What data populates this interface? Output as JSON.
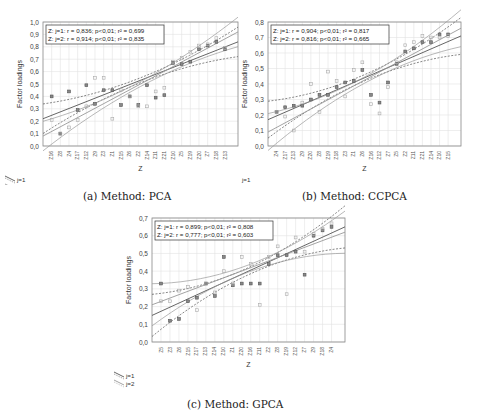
{
  "figure": {
    "captions": [
      "(a) Method: PCA",
      "(b) Method: CCPCA",
      "(c) Method: GPCA"
    ]
  },
  "chart_data": [
    {
      "type": "scatter",
      "title": "(a) Method: PCA",
      "xlabel": "Z",
      "ylabel": "Factor loadings",
      "ylim": [
        0.0,
        1.0
      ],
      "yticks": [
        "0,0",
        "0,1",
        "0,2",
        "0,3",
        "0,4",
        "0,5",
        "0,6",
        "0,7",
        "0,8",
        "0,9",
        "1,0"
      ],
      "grid": true,
      "categories": [
        "Z16",
        "Z8",
        "Z4",
        "Z17",
        "Z12",
        "Z9",
        "Z3",
        "Z1",
        "Z15",
        "Z6",
        "Z2",
        "Z14",
        "Z11",
        "Z21",
        "Z10",
        "Z5",
        "Z19",
        "Z20",
        "Z7",
        "Z18",
        "Z13"
      ],
      "stats_box": [
        "Z: j=1:   r = 0,836; p<0,01; r² = 0,699",
        "Z: j=2:   r = 0,914; p<0,01; r² = 0,835"
      ],
      "legend": [
        "j=1",
        "j=2"
      ],
      "legend_position": "bottom-left outside",
      "series": [
        {
          "name": "j=1",
          "values": [
            0.4,
            0.1,
            0.44,
            0.29,
            0.49,
            0.34,
            0.45,
            0.45,
            0.33,
            0.4,
            0.33,
            0.49,
            0.39,
            0.41,
            0.67,
            0.66,
            0.68,
            0.78,
            0.81,
            0.84,
            0.78
          ]
        },
        {
          "name": "j=2",
          "values": [
            0.21,
            0.1,
            0.15,
            0.21,
            0.32,
            0.55,
            0.55,
            0.22,
            0.45,
            0.4,
            0.32,
            0.32,
            0.44,
            0.47,
            0.68,
            0.71,
            0.76,
            0.81,
            0.82,
            0.87,
            0.79
          ]
        }
      ],
      "fit_lines": [
        {
          "name": "j=1",
          "y_start": 0.22,
          "y_end": 0.84,
          "ci": true
        },
        {
          "name": "j=2",
          "y_start": 0.08,
          "y_end": 0.92,
          "ci": true
        }
      ]
    },
    {
      "type": "scatter",
      "title": "(b) Method: CCPCA",
      "xlabel": "Z",
      "ylabel": "Factor loadings",
      "ylim": [
        0.0,
        0.8
      ],
      "yticks": [
        "0,0",
        "0,1",
        "0,2",
        "0,3",
        "0,4",
        "0,5",
        "0,6",
        "0,7",
        "0,8"
      ],
      "grid": true,
      "categories": [
        "Z4",
        "Z17",
        "Z13",
        "Z9",
        "Z20",
        "Z8",
        "Z19",
        "Z18",
        "Z3",
        "Z1",
        "Z6",
        "Z16",
        "Z12",
        "Z7",
        "Z5",
        "Z2",
        "Z11",
        "Z21",
        "Z14",
        "Z10",
        "Z15"
      ],
      "stats_box": [
        "Z: j=1:   r = 0,904; p<0,01; r² = 0,817",
        "Z: j=2:   r = 0,816; p<0,01; r² = 0,665"
      ],
      "legend": [
        "j=1",
        "j=2"
      ],
      "legend_position": "bottom-left outside",
      "series": [
        {
          "name": "j=1",
          "values": [
            0.22,
            0.25,
            0.26,
            0.26,
            0.3,
            0.33,
            0.33,
            0.38,
            0.41,
            0.42,
            0.49,
            0.33,
            0.28,
            0.41,
            0.53,
            0.61,
            0.63,
            0.67,
            0.67,
            0.72,
            0.72
          ]
        },
        {
          "name": "j=2",
          "values": [
            0.22,
            0.19,
            0.1,
            0.28,
            0.4,
            0.22,
            0.48,
            0.42,
            0.32,
            0.49,
            0.54,
            0.27,
            0.21,
            0.38,
            0.54,
            0.65,
            0.67,
            0.71,
            0.7,
            0.7,
            0.71
          ]
        }
      ],
      "fit_lines": [
        {
          "name": "j=1",
          "y_start": 0.17,
          "y_end": 0.71,
          "ci": true
        },
        {
          "name": "j=2",
          "y_start": 0.09,
          "y_end": 0.76,
          "ci": true
        }
      ]
    },
    {
      "type": "scatter",
      "title": "(c) Method: GPCA",
      "xlabel": "Z",
      "ylabel": "Factor loadings",
      "ylim": [
        0.0,
        0.7
      ],
      "yticks": [
        "0,0",
        "0,1",
        "0,2",
        "0,3",
        "0,4",
        "0,5",
        "0,6",
        "0,7"
      ],
      "grid": true,
      "categories": [
        "Z5",
        "Z3",
        "Z6",
        "Z15",
        "Z17",
        "Z13",
        "Z14",
        "Z10",
        "Z1",
        "Z20",
        "Z16",
        "Z11",
        "Z2",
        "Z8",
        "Z19",
        "Z12",
        "Z7",
        "Z9",
        "Z18",
        "Z4"
      ],
      "stats_box": [
        "Z: j=1:   r = 0,899; p<0,01; r² = 0,808",
        "Z: j=2:   r = 0,777; p<0,01; r² = 0,603"
      ],
      "legend": [
        "j=1",
        "j=2"
      ],
      "legend_position": "bottom-left outside",
      "series": [
        {
          "name": "j=1",
          "values": [
            0.33,
            0.12,
            0.13,
            0.23,
            0.25,
            0.33,
            0.26,
            0.48,
            0.32,
            0.33,
            0.33,
            0.33,
            0.44,
            0.49,
            0.49,
            0.51,
            0.38,
            0.6,
            0.63,
            0.65
          ]
        },
        {
          "name": "j=2",
          "values": [
            0.23,
            0.23,
            0.29,
            0.31,
            0.18,
            0.33,
            0.28,
            0.4,
            0.33,
            0.48,
            0.44,
            0.21,
            0.48,
            0.54,
            0.27,
            0.59,
            0.51,
            0.61,
            0.64,
            0.67
          ]
        }
      ],
      "fit_lines": [
        {
          "name": "j=1",
          "y_start": 0.15,
          "y_end": 0.65,
          "ci": true
        },
        {
          "name": "j=2",
          "y_start": 0.21,
          "y_end": 0.62,
          "ci": true
        }
      ]
    }
  ]
}
